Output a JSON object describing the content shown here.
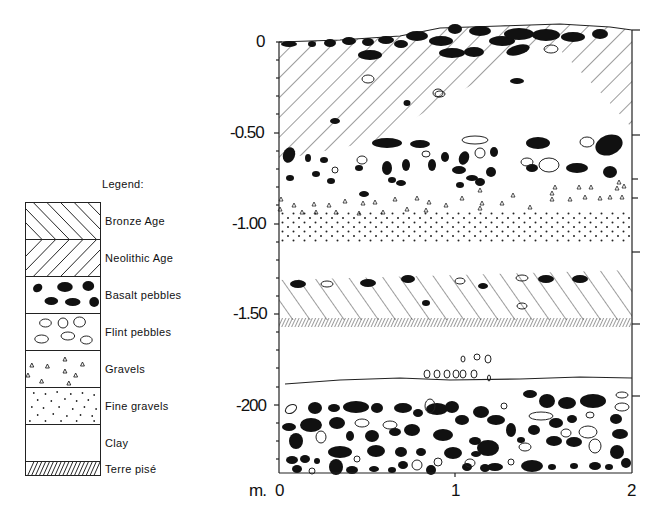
{
  "legend": {
    "title": "Legend:",
    "items": [
      {
        "label": "Bronze Age",
        "pattern": "hatch-backslash"
      },
      {
        "label": "Neolithic Age",
        "pattern": "hatch-slash"
      },
      {
        "label": "Basalt pebbles",
        "pattern": "filled-ellipses"
      },
      {
        "label": "Flint pebbles",
        "pattern": "open-ellipses"
      },
      {
        "label": "Gravels",
        "pattern": "triangles"
      },
      {
        "label": "Fine gravels",
        "pattern": "dots"
      },
      {
        "label": "Clay",
        "pattern": "blank"
      },
      {
        "label": "Terre pisé",
        "pattern": "dense-hatch"
      }
    ]
  },
  "section": {
    "y_axis": {
      "ticks": [
        "0",
        "-0.50",
        "-1.00",
        "-1.50",
        "-2.00"
      ],
      "tick_display": [
        "0",
        "-0.50",
        "-1.00",
        "-1.50",
        "-200"
      ]
    },
    "x_axis": {
      "unit_label": "m.",
      "ticks": [
        "0",
        "1",
        "2"
      ]
    },
    "layers": [
      {
        "name": "Bronze Age with basalt pebbles",
        "from_depth": 0,
        "to_depth": -0.55
      },
      {
        "name": "Basalt & flint pebbles",
        "from_depth": -0.55,
        "to_depth": -0.85
      },
      {
        "name": "Gravels",
        "from_depth": -0.85,
        "to_depth": -0.95
      },
      {
        "name": "Fine gravels",
        "from_depth": -0.95,
        "to_depth": -1.1
      },
      {
        "name": "Clay",
        "from_depth": -1.1,
        "to_depth": -1.3
      },
      {
        "name": "Neolithic Age",
        "from_depth": -1.3,
        "to_depth": -1.57
      },
      {
        "name": "Terre pisé",
        "from_depth": -1.57,
        "to_depth": -1.6
      },
      {
        "name": "Clay with flint pebbles",
        "from_depth": -1.6,
        "to_depth": -1.88
      },
      {
        "name": "Basalt & flint pebbles",
        "from_depth": -1.88,
        "to_depth": -2.35
      }
    ]
  },
  "colors": {
    "ink": "#111111",
    "paper": "#ffffff"
  }
}
